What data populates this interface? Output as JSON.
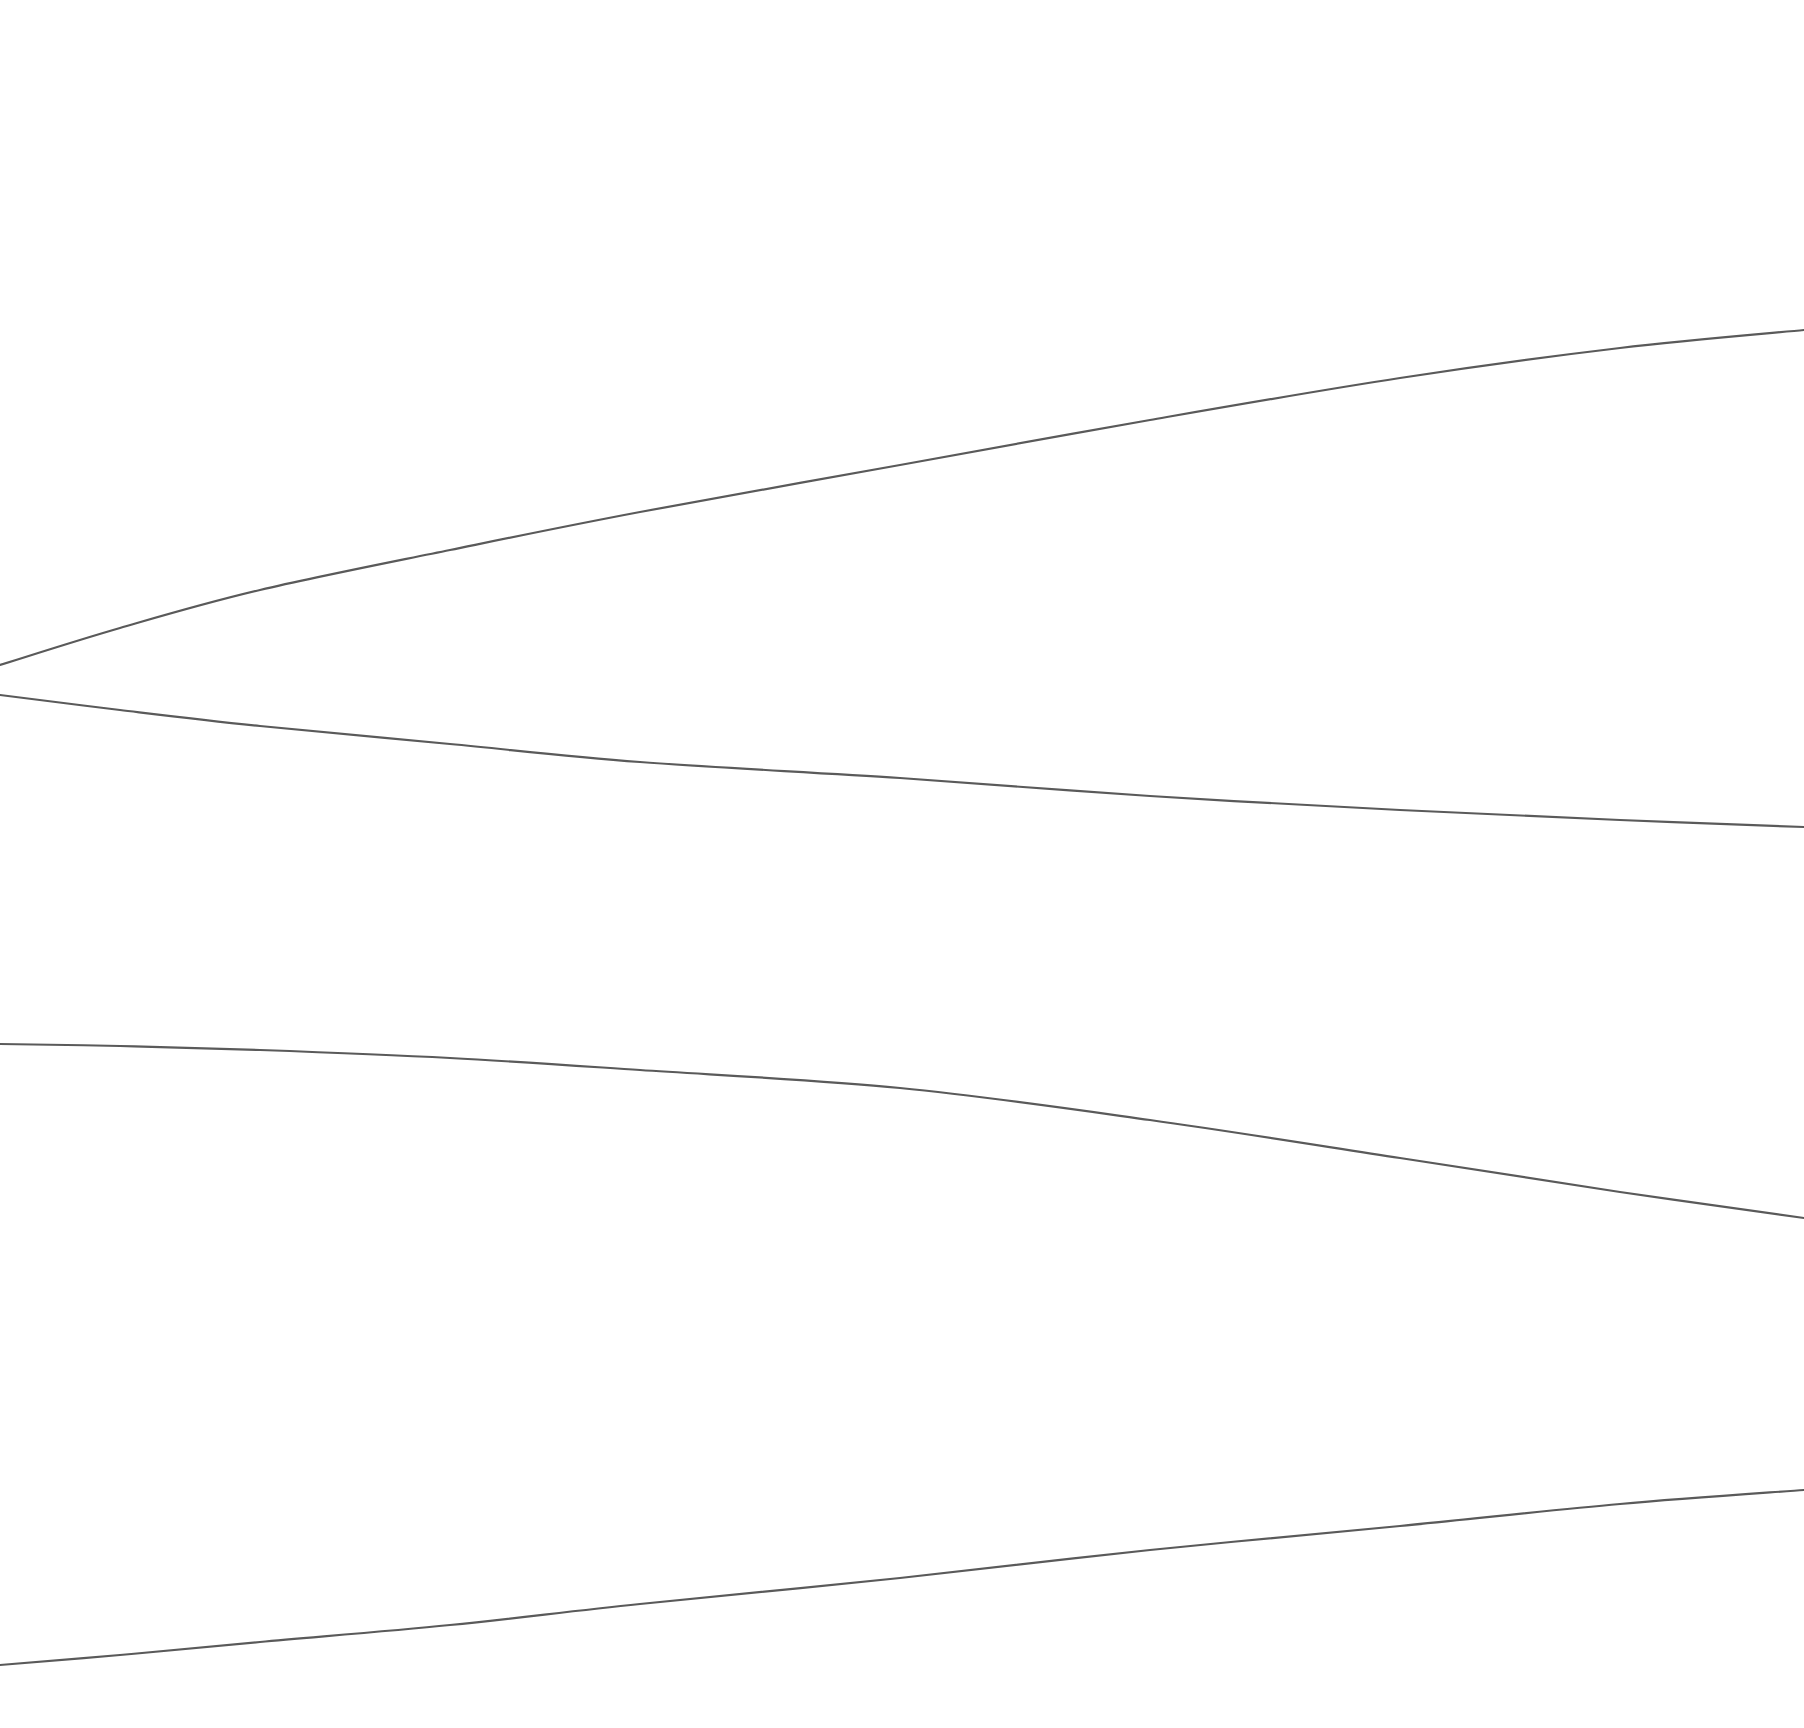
{
  "figure": {
    "title": "",
    "subtitle": "",
    "background_color": "#ffffff",
    "width": 1804,
    "height": 1728,
    "axes_visible": false,
    "grid_visible": false,
    "legend_visible": false,
    "tick_labels_visible": false
  },
  "style": {
    "line_color": "#5a5a5a",
    "line_width": 2.2,
    "line_style": "solid"
  },
  "chart_data": {
    "type": "line",
    "title": "",
    "subtitle": "",
    "xlabel": "",
    "ylabel": "",
    "xlim": [
      0,
      1804
    ],
    "ylim": [
      1728,
      0
    ],
    "grid": false,
    "legend": "none",
    "axes": false,
    "note": "Four smooth unlabeled curves on a blank white canvas; coordinates are in pixel space with y increasing downward. The two upper curves emanate from a near-common point at the left edge and diverge rightward (a fan/bifurcation motif); the lower two curves sweep in opposite vertical directions.",
    "series": [
      {
        "name": "curve-1",
        "description": "upper branch, rises from left convergence point toward upper right",
        "color": "#5a5a5a",
        "x": [
          0,
          120,
          260,
          450,
          640,
          900,
          1150,
          1400,
          1620,
          1804
        ],
        "y": [
          665,
          628,
          590,
          550,
          512,
          465,
          420,
          378,
          348,
          330
        ]
      },
      {
        "name": "curve-2",
        "description": "lower branch of the left convergence point, descends gently toward the right edge",
        "color": "#5a5a5a",
        "x": [
          0,
          120,
          260,
          450,
          640,
          900,
          1150,
          1400,
          1620,
          1804
        ],
        "y": [
          695,
          710,
          726,
          744,
          762,
          778,
          796,
          810,
          820,
          827
        ]
      },
      {
        "name": "curve-3",
        "description": "third curve, nearly flat at left then bends downward to the right",
        "color": "#5a5a5a",
        "x": [
          0,
          120,
          260,
          450,
          640,
          900,
          1150,
          1400,
          1620,
          1804
        ],
        "y": [
          1044,
          1046,
          1050,
          1058,
          1070,
          1088,
          1120,
          1158,
          1192,
          1218
        ]
      },
      {
        "name": "curve-4",
        "description": "bottom curve, rises steadily from the lower left to the right edge",
        "color": "#5a5a5a",
        "x": [
          0,
          120,
          260,
          450,
          640,
          900,
          1150,
          1400,
          1620,
          1804
        ],
        "y": [
          1665,
          1655,
          1642,
          1625,
          1604,
          1578,
          1550,
          1526,
          1504,
          1490
        ]
      }
    ],
    "annotations": []
  }
}
